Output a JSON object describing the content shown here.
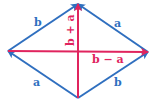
{
  "diagram": {
    "colors": {
      "side": "#2f6fbf",
      "diagonal": "#e0245e"
    },
    "vectors": [
      {
        "id": "a-bottom",
        "label": "a",
        "from": "bottom",
        "to": "left",
        "kind": "side"
      },
      {
        "id": "b-bottom",
        "label": "b",
        "from": "bottom",
        "to": "right",
        "kind": "side"
      },
      {
        "id": "b-top",
        "label": "b",
        "from": "left",
        "to": "top",
        "kind": "side"
      },
      {
        "id": "a-top",
        "label": "a",
        "from": "right",
        "to": "top",
        "kind": "side"
      },
      {
        "id": "sum",
        "label": "b + a",
        "from": "bottom",
        "to": "top",
        "kind": "diagonal"
      },
      {
        "id": "diff",
        "label": "b − a",
        "from": "left",
        "to": "right",
        "kind": "diagonal"
      }
    ]
  }
}
